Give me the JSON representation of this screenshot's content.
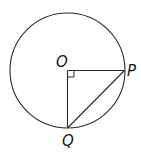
{
  "diagram": {
    "stroke_color": "#2a2a2a",
    "circle": {
      "cx": 67.5,
      "cy": 70.5,
      "r": 57.5
    },
    "points": {
      "O": {
        "label": "O",
        "x": 67.5,
        "y": 70.5
      },
      "P": {
        "label": "P",
        "x": 124.5,
        "y": 70.5
      },
      "Q": {
        "label": "Q",
        "x": 67.5,
        "y": 128
      }
    },
    "segments": [
      "OP",
      "OQ",
      "PQ"
    ],
    "right_angle_marker": {
      "at": "O",
      "size": 6
    }
  }
}
